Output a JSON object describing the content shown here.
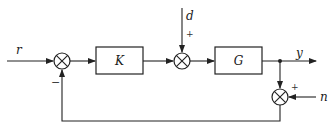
{
  "diagram": {
    "type": "feedback-control-block-diagram",
    "signals": {
      "reference": "r",
      "disturbance": "d",
      "output": "y",
      "noise": "n"
    },
    "blocks": {
      "controller": "K",
      "plant": "G"
    },
    "signs": {
      "feedback_sign": "−",
      "disturbance_sign": "+",
      "noise_sign": "+"
    },
    "colors": {
      "stroke": "#222222",
      "background": "#ffffff"
    }
  }
}
